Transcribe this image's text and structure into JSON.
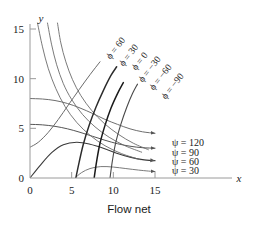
{
  "caption": "Flow net",
  "axes": {
    "x_name": "x",
    "y_name": "y",
    "x_ticks": [
      "0",
      "5",
      "10",
      "15"
    ],
    "y_ticks": [
      "0",
      "5",
      "10",
      "15"
    ]
  },
  "equipotential": {
    "symbol": "ϕ",
    "eq": "=",
    "labels": [
      "60",
      "30",
      "0",
      "−30",
      "−60",
      "−90"
    ]
  },
  "streamlines": {
    "symbol": "ψ",
    "eq": "=",
    "labels": [
      "120",
      "90",
      "60",
      "30"
    ]
  },
  "chart_data": {
    "type": "line",
    "title": "Flow net",
    "xlabel": "x",
    "ylabel": "y",
    "xlim": [
      0,
      16.2
    ],
    "ylim": [
      0,
      16.2
    ],
    "grid": false,
    "legend_position": "right-inside",
    "series": [
      {
        "name": "ψ = 120",
        "kind": "streamline",
        "label": "ψ = 120",
        "value": 120,
        "color": "#6e6e6e",
        "width": 1.0,
        "arrow_end": true,
        "points": [
          [
            0,
            8.0
          ],
          [
            1.5,
            7.95
          ],
          [
            3.0,
            7.8
          ],
          [
            4.5,
            7.5
          ],
          [
            6.0,
            7.05
          ],
          [
            7.5,
            6.5
          ],
          [
            9.0,
            5.9
          ],
          [
            10.5,
            5.4
          ],
          [
            12.0,
            4.95
          ],
          [
            13.5,
            4.65
          ],
          [
            15.0,
            4.5
          ]
        ]
      },
      {
        "name": "ψ = 90",
        "kind": "streamline",
        "label": "ψ = 90",
        "value": 90,
        "color": "#555555",
        "width": 1.0,
        "arrow_end": true,
        "points": [
          [
            0,
            5.4
          ],
          [
            1.5,
            5.35
          ],
          [
            3.0,
            5.2
          ],
          [
            4.5,
            4.95
          ],
          [
            6.0,
            4.6
          ],
          [
            7.5,
            4.2
          ],
          [
            9.0,
            3.8
          ],
          [
            10.5,
            3.45
          ],
          [
            12.0,
            3.2
          ],
          [
            13.5,
            3.05
          ],
          [
            15.0,
            3.0
          ]
        ]
      },
      {
        "name": "ψ = 60",
        "kind": "streamline",
        "label": "ψ = 60",
        "value": 60,
        "color": "#3a3a3a",
        "width": 1.1,
        "arrow_end": true,
        "points": [
          [
            0,
            0
          ],
          [
            1.2,
            1.25
          ],
          [
            2.6,
            2.55
          ],
          [
            4.0,
            3.35
          ],
          [
            5.6,
            3.6
          ],
          [
            7.2,
            3.4
          ],
          [
            8.8,
            3.0
          ],
          [
            10.4,
            2.5
          ],
          [
            12.0,
            2.1
          ],
          [
            13.5,
            1.85
          ],
          [
            15.0,
            1.75
          ]
        ]
      },
      {
        "name": "ψ = 30",
        "kind": "streamline",
        "label": "ψ = 30",
        "value": 30,
        "color": "#7a7a7a",
        "width": 1.0,
        "arrow_end": true,
        "points": [
          [
            5.4,
            0
          ],
          [
            6.2,
            0.55
          ],
          [
            7.2,
            0.95
          ],
          [
            8.5,
            1.15
          ],
          [
            10.0,
            1.1
          ],
          [
            11.5,
            0.95
          ],
          [
            13.0,
            0.8
          ],
          [
            14.2,
            0.7
          ],
          [
            15.0,
            0.65
          ]
        ]
      },
      {
        "name": "ϕ = 60",
        "kind": "equipotential",
        "label": "ϕ = 60",
        "value": 60,
        "color": "#6b6b6b",
        "width": 0.9,
        "points": [
          [
            0.9,
            15.6
          ],
          [
            1.5,
            13.2
          ],
          [
            2.2,
            11.0
          ],
          [
            3.1,
            9.0
          ],
          [
            4.2,
            7.2
          ],
          [
            5.6,
            5.6
          ],
          [
            7.2,
            4.3
          ],
          [
            9.0,
            3.25
          ],
          [
            11.0,
            2.45
          ],
          [
            13.2,
            1.85
          ]
        ]
      },
      {
        "name": "ϕ = 30",
        "kind": "equipotential",
        "label": "ϕ = 30",
        "value": 30,
        "color": "#6b6b6b",
        "width": 0.9,
        "points": [
          [
            2.1,
            15.6
          ],
          [
            2.6,
            13.4
          ],
          [
            3.2,
            11.4
          ],
          [
            4.0,
            9.5
          ],
          [
            5.0,
            7.9
          ],
          [
            6.3,
            6.4
          ],
          [
            7.8,
            5.15
          ],
          [
            9.5,
            4.1
          ],
          [
            11.4,
            3.25
          ],
          [
            13.4,
            2.6
          ]
        ]
      },
      {
        "name": "ϕ = 0",
        "kind": "equipotential",
        "label": "ϕ = 0",
        "value": 0,
        "color": "#6b6b6b",
        "width": 0.9,
        "points": [
          [
            3.3,
            15.6
          ],
          [
            3.7,
            13.6
          ],
          [
            4.3,
            11.7
          ],
          [
            5.1,
            9.9
          ],
          [
            6.1,
            8.3
          ],
          [
            7.4,
            6.8
          ],
          [
            8.9,
            5.5
          ],
          [
            10.6,
            4.4
          ],
          [
            12.4,
            3.5
          ],
          [
            14.2,
            2.85
          ]
        ]
      },
      {
        "name": "ϕ = −30",
        "kind": "equipotential",
        "label": "ϕ = −30",
        "value": -30,
        "color": "#6b6b6b",
        "width": 1.0,
        "points": [
          [
            0,
            3.1
          ],
          [
            1.0,
            3.6
          ],
          [
            2.2,
            4.6
          ],
          [
            3.4,
            5.9
          ],
          [
            4.6,
            7.35
          ],
          [
            5.9,
            8.9
          ],
          [
            7.2,
            10.4
          ],
          [
            8.4,
            11.7
          ]
        ]
      },
      {
        "name": "ϕ = −60",
        "kind": "equipotential",
        "label": "ϕ = −60",
        "value": -60,
        "color": "#2b2b2b",
        "width": 1.45,
        "points": [
          [
            5.5,
            0
          ],
          [
            5.9,
            1.6
          ],
          [
            6.4,
            3.4
          ],
          [
            7.1,
            5.3
          ],
          [
            7.9,
            7.1
          ],
          [
            8.8,
            8.8
          ],
          [
            9.7,
            10.3
          ],
          [
            10.4,
            11.2
          ]
        ]
      },
      {
        "name": "ϕ = −90",
        "kind": "equipotential",
        "label": "ϕ = −90",
        "value": -90,
        "color": "#1a1a1a",
        "width": 1.5,
        "points": [
          [
            7.7,
            0
          ],
          [
            8.0,
            1.7
          ],
          [
            8.4,
            3.5
          ],
          [
            9.0,
            5.3
          ],
          [
            9.7,
            7.0
          ],
          [
            10.5,
            8.5
          ],
          [
            11.2,
            9.6
          ]
        ]
      },
      {
        "name": "outer",
        "kind": "equipotential",
        "label": "",
        "value": null,
        "color": "#4a4a4a",
        "width": 1.1,
        "points": [
          [
            9.6,
            0
          ],
          [
            9.9,
            1.8
          ],
          [
            10.3,
            3.6
          ],
          [
            10.9,
            5.4
          ],
          [
            11.6,
            7.1
          ],
          [
            12.3,
            8.5
          ],
          [
            12.9,
            9.45
          ]
        ]
      }
    ]
  }
}
